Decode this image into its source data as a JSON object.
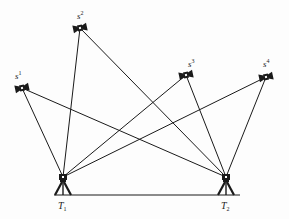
{
  "diagram": {
    "type": "GPS relative positioning geometry",
    "line_color": "#1a1a1a",
    "satellites": [
      {
        "id": "s1",
        "base": "s",
        "index": "1",
        "x": 22,
        "y": 88,
        "label_x": 15,
        "label_y": 79
      },
      {
        "id": "s2",
        "base": "s",
        "index": "2",
        "x": 80,
        "y": 28,
        "label_x": 77,
        "label_y": 19
      },
      {
        "id": "s3",
        "base": "s",
        "index": "3",
        "x": 186,
        "y": 75,
        "label_x": 188,
        "label_y": 67
      },
      {
        "id": "s4",
        "base": "s",
        "index": "4",
        "x": 266,
        "y": 77,
        "label_x": 263,
        "label_y": 67
      }
    ],
    "receivers": [
      {
        "id": "T1",
        "base": "T",
        "index": "1",
        "x": 63,
        "y": 177,
        "label_x": 58,
        "label_y": 209
      },
      {
        "id": "T2",
        "base": "T",
        "index": "2",
        "x": 226,
        "y": 177,
        "label_x": 221,
        "label_y": 209
      }
    ],
    "baseline": {
      "x1": 54,
      "y1": 195,
      "x2": 240,
      "y2": 195
    },
    "connections": [
      [
        "s1",
        "T1"
      ],
      [
        "s1",
        "T2"
      ],
      [
        "s2",
        "T1"
      ],
      [
        "s2",
        "T2"
      ],
      [
        "s3",
        "T1"
      ],
      [
        "s3",
        "T2"
      ],
      [
        "s4",
        "T1"
      ],
      [
        "s4",
        "T2"
      ]
    ]
  }
}
